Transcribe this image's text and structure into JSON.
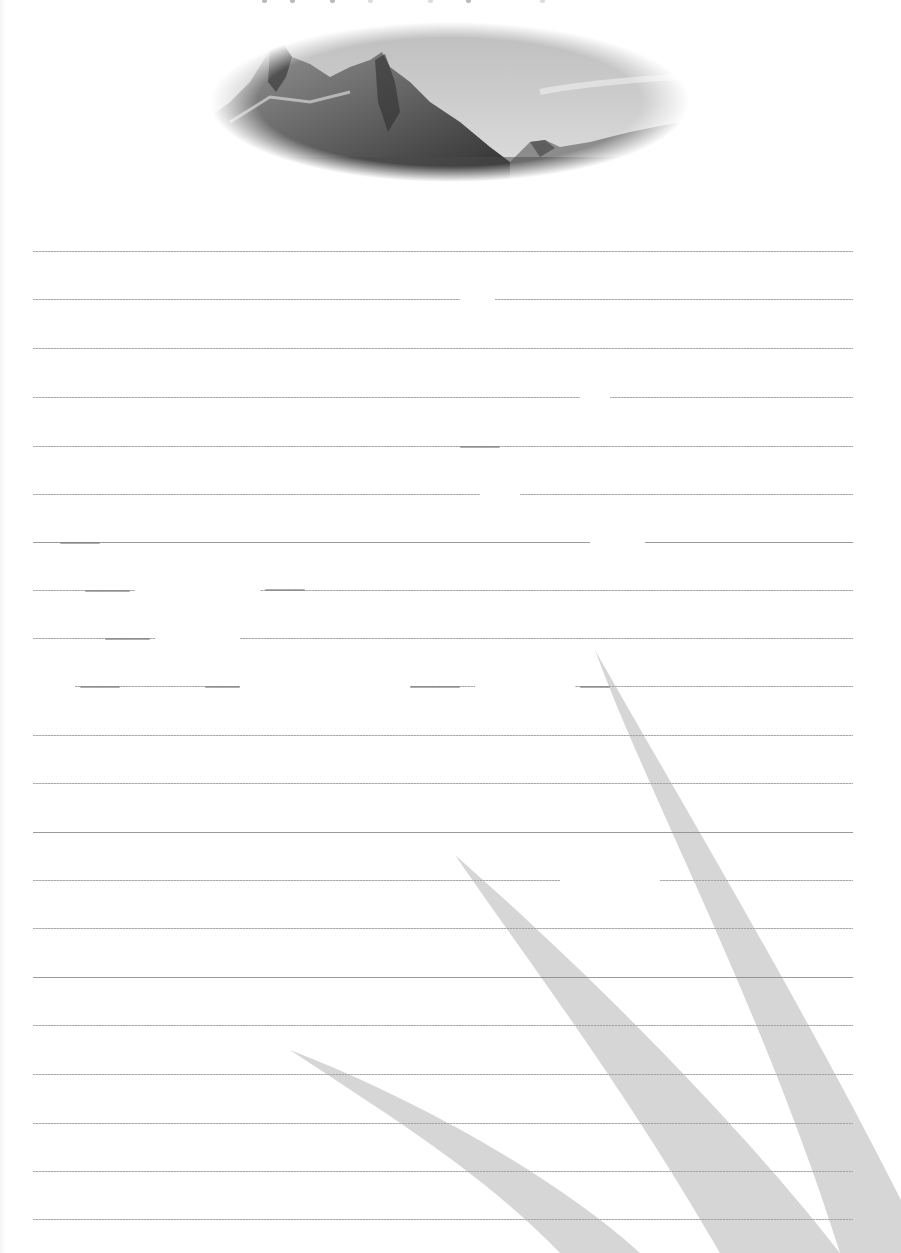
{
  "document": {
    "type": "lined-stationery",
    "header_text": "",
    "header_note": "clipped / illegible",
    "banner": {
      "subject": "mountain-landscape",
      "shape": "oval-vignette",
      "tone": "grayscale"
    },
    "ruled_lines": {
      "count": 21,
      "y_positions": [
        251,
        299,
        348,
        397,
        446,
        494,
        542,
        590,
        638,
        686,
        735,
        783,
        832,
        880,
        928,
        977,
        1025,
        1074,
        1123,
        1171,
        1219
      ],
      "x_start": 33,
      "x_end": 853,
      "color": "#9a9a9a"
    },
    "decoration": {
      "subject": "grass-blades",
      "count": 3,
      "color": "#d6d6d6"
    },
    "colors": {
      "paper": "#ffffff",
      "line": "#9a9a9a",
      "grass": "#d6d6d6",
      "banner_dark": "#3a3a3a",
      "banner_sky": "#cfcfcf"
    }
  }
}
